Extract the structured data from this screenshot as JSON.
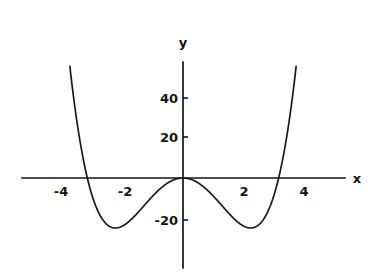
{
  "figure": {
    "background_color": "#ffffff",
    "ink_color": "#141414"
  },
  "axes": {
    "x_axis_label": "x",
    "y_axis_label": "y",
    "x_tick_labels": [
      "-4",
      "-2",
      "2",
      "4"
    ],
    "y_tick_labels": [
      "40",
      "20",
      "-20"
    ]
  },
  "chart_data": {
    "type": "line",
    "title": "",
    "xlabel": "x",
    "ylabel": "y",
    "grid": false,
    "legend": null,
    "xlim": [
      -4.6,
      4.6
    ],
    "ylim": [
      -32,
      58
    ],
    "xticks": [
      -4,
      -2,
      2,
      4
    ],
    "xtick_labels": [
      "-4",
      "-2",
      "2",
      "4"
    ],
    "yticks": [
      40,
      20,
      -20
    ],
    "ytick_labels": [
      "40",
      "20",
      "-20"
    ],
    "axis_style": "origin-crossed-arrowless",
    "series": [
      {
        "name": "y = x^4 - 10x^2",
        "equation": "y = x^4 - 10x^2",
        "roots": [
          -3.162,
          0,
          3.162
        ],
        "local_maximum": {
          "x": 0,
          "y": 0
        },
        "local_minima": [
          {
            "x": -2.236,
            "y": -25
          },
          {
            "x": 2.236,
            "y": -25
          }
        ],
        "x": [
          -4.0,
          -3.8,
          -3.6,
          -3.4,
          -3.2,
          -3.0,
          -2.8,
          -2.6,
          -2.4,
          -2.2,
          -2.0,
          -1.8,
          -1.6,
          -1.4,
          -1.2,
          -1.0,
          -0.8,
          -0.6,
          -0.4,
          -0.2,
          0.0,
          0.2,
          0.4,
          0.6,
          0.8,
          1.0,
          1.2,
          1.4,
          1.6,
          1.8,
          2.0,
          2.2,
          2.4,
          2.6,
          2.8,
          3.0,
          3.2,
          3.4,
          3.6,
          3.8,
          4.0
        ],
        "y": [
          96.0,
          64.2,
          38.2,
          17.9,
          2.5,
          -9.0,
          -17.0,
          -22.0,
          -24.4,
          -25.0,
          -24.0,
          -21.9,
          -19.1,
          -15.8,
          -12.3,
          -9.0,
          -5.9,
          -3.5,
          -1.6,
          -0.4,
          0.0,
          -0.4,
          -1.6,
          -3.5,
          -5.9,
          -9.0,
          -12.3,
          -15.8,
          -19.1,
          -21.9,
          -24.0,
          -25.0,
          -24.4,
          -22.0,
          -17.0,
          -9.0,
          2.5,
          17.9,
          38.2,
          64.2,
          96.0
        ]
      }
    ]
  }
}
